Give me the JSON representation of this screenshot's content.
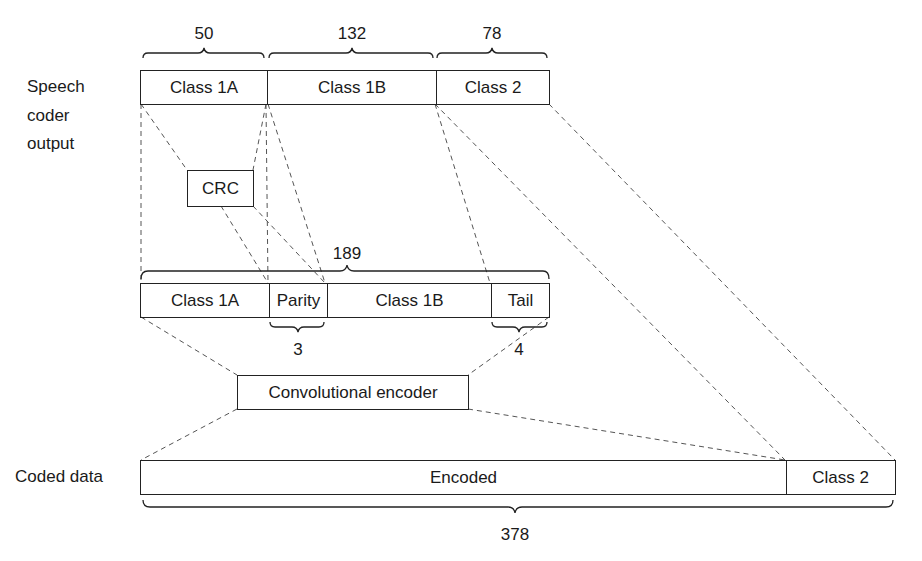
{
  "diagram": {
    "row_labels": {
      "speech_coder_output": [
        "Speech",
        "coder",
        "output"
      ],
      "coded_data": "Coded data"
    },
    "speech_coder_row": {
      "segments": [
        {
          "label": "Class 1A",
          "bits": "50"
        },
        {
          "label": "Class 1B",
          "bits": "132"
        },
        {
          "label": "Class 2",
          "bits": "78"
        }
      ]
    },
    "crc_box": {
      "label": "CRC"
    },
    "protected_row": {
      "total_bits": "189",
      "segments": [
        {
          "label": "Class 1A"
        },
        {
          "label": "Parity",
          "bits": "3"
        },
        {
          "label": "Class 1B"
        },
        {
          "label": "Tail",
          "bits": "4"
        }
      ]
    },
    "encoder_box": {
      "label": "Convolutional encoder"
    },
    "coded_row": {
      "total_bits": "378",
      "segments": [
        {
          "label": "Encoded"
        },
        {
          "label": "Class 2"
        }
      ]
    },
    "colors": {
      "line": "#222222",
      "dashed": "#555555",
      "background": "#ffffff"
    }
  }
}
